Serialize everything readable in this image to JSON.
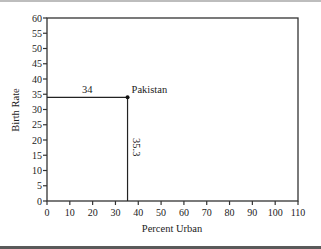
{
  "chart_data": {
    "type": "scatter",
    "title": "",
    "xlabel": "Percent Urban",
    "ylabel": "Birth Rate",
    "xlim": [
      0,
      110
    ],
    "ylim": [
      0,
      60
    ],
    "xticks": [
      0,
      10,
      20,
      30,
      40,
      50,
      60,
      70,
      80,
      90,
      100,
      110
    ],
    "yticks": [
      0,
      5,
      10,
      15,
      20,
      25,
      30,
      35,
      40,
      45,
      50,
      55,
      60
    ],
    "grid": false,
    "legend": null,
    "series": [
      {
        "name": "Pakistan",
        "points": [
          {
            "x": 35.3,
            "y": 34,
            "label": "Pakistan"
          }
        ]
      }
    ],
    "annotations": [
      {
        "text": "34",
        "type": "horizontal-guide",
        "from_x": 0,
        "to_x": 35.3,
        "y": 34
      },
      {
        "text": "35.3",
        "type": "vertical-guide",
        "x": 35.3,
        "from_y": 0,
        "to_y": 34
      },
      {
        "text": "Pakistan",
        "type": "point-label",
        "x": 35.3,
        "y": 34
      }
    ]
  },
  "labels": {
    "xlabel": "Percent Urban",
    "ylabel": "Birth Rate",
    "point_label": "Pakistan",
    "h_guide_value": "34",
    "v_guide_value": "35.3"
  }
}
